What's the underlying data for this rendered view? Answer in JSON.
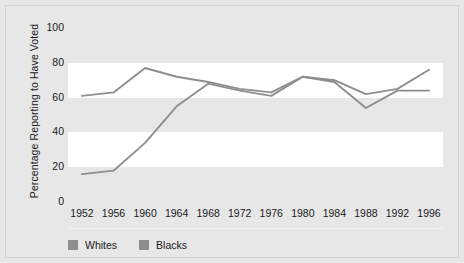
{
  "chart_data": {
    "type": "line",
    "title": "",
    "xlabel": "",
    "ylabel": "Percentage Reporting to Have Voted",
    "categories": [
      "1952",
      "1956",
      "1960",
      "1964",
      "1968",
      "1972",
      "1976",
      "1980",
      "1984",
      "1988",
      "1992",
      "1996"
    ],
    "ylim": [
      0,
      100
    ],
    "yticks": [
      0,
      20,
      40,
      60,
      80,
      100
    ],
    "grid": "horizontal-bands",
    "legend_position": "bottom-left",
    "series": [
      {
        "name": "Whites",
        "color": "#8e8e8e",
        "values": [
          61,
          63,
          77,
          72,
          69,
          65,
          63,
          72,
          70,
          62,
          65,
          76
        ]
      },
      {
        "name": "Blacks",
        "color": "#8e8e8e",
        "values": [
          16,
          18,
          34,
          55,
          68,
          64,
          61,
          72,
          69,
          54,
          64,
          64
        ]
      }
    ]
  },
  "legend": {
    "items": [
      {
        "label": "Whites"
      },
      {
        "label": "Blacks"
      }
    ]
  },
  "colors": {
    "page_background": "#e7e7e7",
    "plot_background": "#ffffff",
    "band": "#e7e7e7",
    "line": "#8e8e8e",
    "text": "#1a1a1a"
  }
}
